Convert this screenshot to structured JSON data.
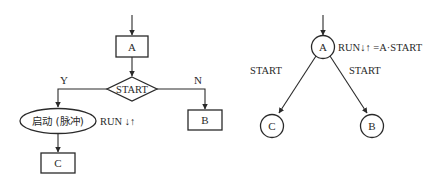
{
  "flowchart": {
    "box_a": "A",
    "decision": "START",
    "yes_label": "Y",
    "no_label": "N",
    "action_ellipse": "启动 (脉冲)",
    "action_note": "RUN ↓↑",
    "box_b": "B",
    "box_c": "C"
  },
  "state_diagram": {
    "state_a": "A",
    "state_a_output": "RUN↓↑ =A·START",
    "state_b": "B",
    "state_c": "C",
    "transition_to_c": "START",
    "transition_to_b": "START"
  },
  "colors": {
    "line": "#2a2a2a",
    "background": "#ffffff"
  }
}
